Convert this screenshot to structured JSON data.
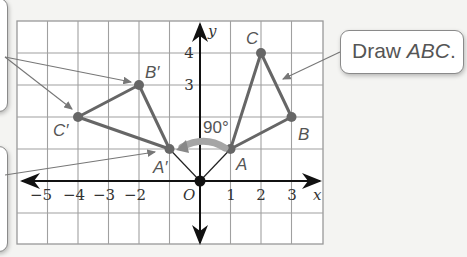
{
  "callouts": {
    "right": {
      "prefix": "Draw ",
      "italic": "ABC",
      "suffix": "."
    },
    "left_top": {
      "text": ""
    },
    "left_bottom": {
      "text": ""
    }
  },
  "axes": {
    "x_label": "x",
    "y_label": "y",
    "origin_label": "O",
    "x_ticks": [
      "−5",
      "−4",
      "−3",
      "−2",
      "1",
      "2",
      "3"
    ],
    "y_ticks": [
      "4",
      "3"
    ]
  },
  "angle_label": "90°",
  "points": {
    "A": {
      "label": "A",
      "x": 1,
      "y": 1
    },
    "B": {
      "label": "B",
      "x": 3,
      "y": 2
    },
    "C": {
      "label": "C",
      "x": 2,
      "y": 4
    },
    "A_prime": {
      "label": "A′",
      "x": -1,
      "y": 1
    },
    "B_prime": {
      "label": "B′",
      "x": -2,
      "y": 3
    },
    "C_prime": {
      "label": "C′",
      "x": -4,
      "y": 2
    }
  },
  "colors": {
    "triangle": "#666666",
    "grid": "#999999",
    "axis": "#111111",
    "arrow_rotation": "#9a9a9a"
  }
}
